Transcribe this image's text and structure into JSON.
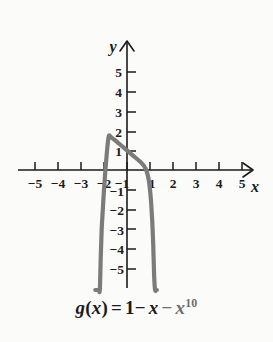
{
  "figure": {
    "background_color": "#fbfbfa",
    "caption": {
      "full": "g(x) = 1 - x - x^10",
      "fn_name": "g",
      "open_paren": "(",
      "variable": "x",
      "close_paren": ")",
      "equals": "=",
      "constant": "1",
      "minus_one": "−",
      "linear_var": "x",
      "minus_two": "−",
      "power_var": "x",
      "exponent": "10"
    }
  },
  "chart_data": {
    "type": "line",
    "function": "g(x) = 1 - x - x^10",
    "xlabel": "x",
    "ylabel": "y",
    "xlim": [
      -5.8,
      5.8
    ],
    "ylim": [
      -5.8,
      5.8
    ],
    "grid": false,
    "legend": null,
    "axis_arrows": [
      "x-positive",
      "y-positive"
    ],
    "curve_color": "#7b7b7b",
    "curve_width": 4.2,
    "x_ticks": [
      -5,
      -4,
      -3,
      -2,
      -1,
      1,
      2,
      3,
      4,
      5
    ],
    "x_tick_labels": [
      "−5",
      "−4",
      "−3",
      "−2",
      "−1",
      "1",
      "2",
      "3",
      "4",
      "5"
    ],
    "y_ticks": [
      5,
      4,
      3,
      2,
      1,
      -1,
      -2,
      -3,
      -4,
      -5
    ],
    "y_tick_labels": [
      "5",
      "4",
      "3",
      "2",
      "1",
      "−1",
      "−2",
      "−3",
      "−4",
      "−5"
    ],
    "vertex": {
      "x": -0.2,
      "y": 1.6
    },
    "x_intercepts": [
      -1.05,
      0.85
    ],
    "y_intercept": 1,
    "x": [
      -1.38,
      -1.34,
      -1.3,
      -1.26,
      -1.22,
      -1.18,
      -1.14,
      -1.1,
      -1.05,
      -1.0,
      -0.9,
      -0.8,
      -0.7,
      -0.6,
      -0.5,
      -0.4,
      -0.3,
      -0.2,
      -0.1,
      0.0,
      0.1,
      0.2,
      0.3,
      0.4,
      0.5,
      0.6,
      0.7,
      0.8,
      0.85,
      0.9,
      0.95,
      1.0,
      1.05,
      1.1,
      1.14,
      1.18,
      1.22,
      1.26,
      1.3
    ],
    "values": [
      -21.6,
      -17.3,
      -13.7,
      -10.7,
      -8.2,
      -6.1,
      -4.4,
      -3.0,
      -2.0,
      -1.0,
      0.55,
      1.69,
      1.67,
      1.59,
      1.5,
      1.4,
      1.3,
      1.2,
      1.1,
      1.0,
      0.9,
      0.8,
      0.7,
      0.6,
      0.5,
      0.39,
      0.27,
      0.09,
      -0.05,
      -0.25,
      -0.55,
      -1.0,
      -1.68,
      -2.69,
      -3.8,
      -5.39,
      -7.5,
      -10.3,
      -13.9
    ]
  },
  "axes": {
    "y_axis_name": "y",
    "x_axis_name": "x"
  }
}
